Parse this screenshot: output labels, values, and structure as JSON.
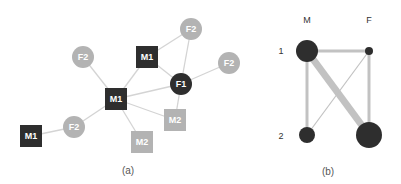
{
  "colors": {
    "dark_node": "#2e2e2e",
    "light_node": "#b3b3b3",
    "edge": "#d4d4d4",
    "edge_b": "#c2c2c2",
    "text_light": "#ffffff",
    "caption": "#555555"
  },
  "panel_a": {
    "caption": "(a)",
    "nodes": [
      {
        "id": "m1_center",
        "label": "M1",
        "shape": "square",
        "shade": "dark",
        "x": 116,
        "y": 99
      },
      {
        "id": "m1_top",
        "label": "M1",
        "shape": "square",
        "shade": "dark",
        "x": 147,
        "y": 57
      },
      {
        "id": "m1_left",
        "label": "M1",
        "shape": "square",
        "shade": "dark",
        "x": 31,
        "y": 136
      },
      {
        "id": "f1",
        "label": "F1",
        "shape": "circle",
        "shade": "dark",
        "x": 181,
        "y": 84
      },
      {
        "id": "f2_topleft",
        "label": "F2",
        "shape": "circle",
        "shade": "light",
        "x": 83,
        "y": 57
      },
      {
        "id": "f2_top",
        "label": "F2",
        "shape": "circle",
        "shade": "light",
        "x": 191,
        "y": 29
      },
      {
        "id": "f2_right",
        "label": "F2",
        "shape": "circle",
        "shade": "light",
        "x": 229,
        "y": 63
      },
      {
        "id": "f2_bottomleft",
        "label": "F2",
        "shape": "circle",
        "shade": "light",
        "x": 74,
        "y": 127
      },
      {
        "id": "m2_right",
        "label": "M2",
        "shape": "square",
        "shade": "light",
        "x": 175,
        "y": 120
      },
      {
        "id": "m2_bottom",
        "label": "M2",
        "shape": "square",
        "shade": "light",
        "x": 142,
        "y": 142
      }
    ],
    "edges": [
      [
        "m1_center",
        "f2_topleft"
      ],
      [
        "m1_center",
        "m1_top"
      ],
      [
        "m1_center",
        "f1"
      ],
      [
        "m1_center",
        "m2_right"
      ],
      [
        "m1_center",
        "m2_bottom"
      ],
      [
        "m1_center",
        "f2_bottomleft"
      ],
      [
        "f2_bottomleft",
        "m1_left"
      ],
      [
        "m1_top",
        "f2_top"
      ],
      [
        "m1_top",
        "f1"
      ],
      [
        "f1",
        "f2_top"
      ],
      [
        "f1",
        "f2_right"
      ],
      [
        "f1",
        "m2_right"
      ]
    ]
  },
  "panel_b": {
    "caption": "(b)",
    "column_labels": [
      "M",
      "F"
    ],
    "row_labels": [
      "1",
      "2"
    ],
    "nodes": [
      {
        "id": "M1",
        "x": 307,
        "y": 51,
        "r": 11
      },
      {
        "id": "F1",
        "x": 369,
        "y": 51,
        "r": 4
      },
      {
        "id": "M2",
        "x": 307,
        "y": 135,
        "r": 8
      },
      {
        "id": "F2",
        "x": 369,
        "y": 135,
        "r": 13
      }
    ],
    "edges": [
      {
        "from": "M1",
        "to": "F1",
        "width": 3
      },
      {
        "from": "M1",
        "to": "M2",
        "width": 3
      },
      {
        "from": "M1",
        "to": "F2",
        "width": 7
      },
      {
        "from": "F1",
        "to": "F2",
        "width": 3
      },
      {
        "from": "F1",
        "to": "M2",
        "width": 1.2
      }
    ]
  }
}
